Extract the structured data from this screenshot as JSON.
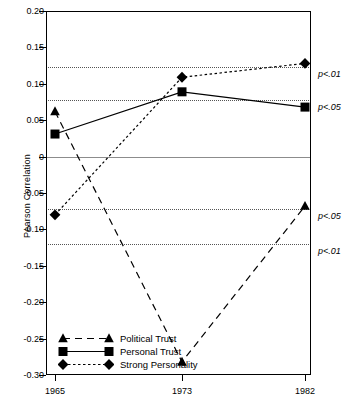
{
  "chart_data": {
    "type": "line",
    "title": "",
    "xlabel": "",
    "ylabel": "Pearson Correlation",
    "categories": [
      "1965",
      "1973",
      "1982"
    ],
    "x": [
      1965,
      1973,
      1982
    ],
    "ylim": [
      -0.3,
      0.2
    ],
    "yticks": [
      0.2,
      0.15,
      0.1,
      0.05,
      0,
      -0.05,
      -0.1,
      -0.15,
      -0.2,
      -0.25,
      -0.3
    ],
    "ytick_labels": [
      "0.20",
      "0.15",
      "0.10",
      "0.05",
      "0",
      "-0.05",
      "-0.10",
      "-0.15",
      "-0.20",
      "-0.25",
      "-0.30"
    ],
    "grid": false,
    "legend_position": "bottom-left",
    "series": [
      {
        "name": "Political Trust",
        "marker": "triangle",
        "linestyle": "dashed",
        "values": [
          0.062,
          -0.282,
          -0.068
        ]
      },
      {
        "name": "Personal Trust",
        "marker": "square",
        "linestyle": "solid",
        "values": [
          0.031,
          0.089,
          0.068
        ]
      },
      {
        "name": "Strong Personality",
        "marker": "diamond",
        "linestyle": "dotted",
        "values": [
          -0.08,
          0.109,
          0.128
        ]
      }
    ],
    "reference_lines": [
      {
        "label": "p<.01",
        "value": 0.123
      },
      {
        "label": "p<.05",
        "value": 0.078
      },
      {
        "label": "p<.05",
        "value": -0.072
      },
      {
        "label": "p<.01",
        "value": -0.12
      }
    ],
    "zero_line": 0,
    "colors": {
      "series": "#000000",
      "axis": "#000000",
      "reference_line": "#555555",
      "zero_line": "#8c8c8c",
      "background": "#ffffff"
    }
  }
}
